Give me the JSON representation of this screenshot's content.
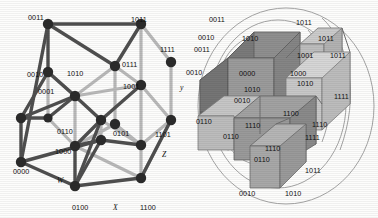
{
  "figure": {
    "panels": [
      {
        "id": "left",
        "name": "hypercube-graph",
        "type": "tesseract-wireframe",
        "axis_labels": [
          {
            "text": "W",
            "x": 57,
            "y": 177
          },
          {
            "text": "X",
            "x": 113,
            "y": 204
          },
          {
            "text": "Z",
            "x": 162,
            "y": 151
          },
          {
            "text": "y",
            "x": 180,
            "y": 84
          }
        ],
        "vertex_labels": [
          {
            "text": "0011",
            "x": 28,
            "y": 14
          },
          {
            "text": "1011",
            "x": 131,
            "y": 16
          },
          {
            "text": "1111",
            "x": 160,
            "y": 46
          },
          {
            "text": "0010",
            "x": 27,
            "y": 71
          },
          {
            "text": "1010",
            "x": 67,
            "y": 70
          },
          {
            "text": "0111",
            "x": 122,
            "y": 61
          },
          {
            "text": "1001",
            "x": 123,
            "y": 83
          },
          {
            "text": "0001",
            "x": 38,
            "y": 88
          },
          {
            "text": "0110",
            "x": 57,
            "y": 128
          },
          {
            "text": "0101",
            "x": 113,
            "y": 130
          },
          {
            "text": "1101",
            "x": 155,
            "y": 131
          },
          {
            "text": "1000",
            "x": 55,
            "y": 148
          },
          {
            "text": "0000",
            "x": 13,
            "y": 168
          },
          {
            "text": "0100",
            "x": 72,
            "y": 204
          },
          {
            "text": "1100",
            "x": 140,
            "y": 204
          }
        ]
      },
      {
        "id": "right",
        "name": "nested-cubes-diagram",
        "type": "cube-cluster-with-contours",
        "vertex_labels": [
          {
            "text": "0011",
            "x": 209,
            "y": 16
          },
          {
            "text": "1011",
            "x": 296,
            "y": 19
          },
          {
            "text": "0010",
            "x": 198,
            "y": 34
          },
          {
            "text": "1010",
            "x": 242,
            "y": 35
          },
          {
            "text": "1011",
            "x": 318,
            "y": 35
          },
          {
            "text": "0011",
            "x": 194,
            "y": 46
          },
          {
            "text": "1001",
            "x": 297,
            "y": 52
          },
          {
            "text": "1011",
            "x": 330,
            "y": 52
          },
          {
            "text": "0010",
            "x": 186,
            "y": 69
          },
          {
            "text": "0000",
            "x": 239,
            "y": 70
          },
          {
            "text": "1000",
            "x": 290,
            "y": 70
          },
          {
            "text": "1010",
            "x": 297,
            "y": 80
          },
          {
            "text": "1010",
            "x": 244,
            "y": 86
          },
          {
            "text": "0010",
            "x": 234,
            "y": 97
          },
          {
            "text": "1111",
            "x": 334,
            "y": 93
          },
          {
            "text": "0110",
            "x": 196,
            "y": 118
          },
          {
            "text": "1100",
            "x": 283,
            "y": 110
          },
          {
            "text": "1110",
            "x": 245,
            "y": 122
          },
          {
            "text": "1110",
            "x": 312,
            "y": 121
          },
          {
            "text": "0110",
            "x": 223,
            "y": 133
          },
          {
            "text": "1111",
            "x": 305,
            "y": 134
          },
          {
            "text": "1110",
            "x": 265,
            "y": 145
          },
          {
            "text": "0110",
            "x": 254,
            "y": 156
          },
          {
            "text": "1011",
            "x": 305,
            "y": 167
          },
          {
            "text": "0010",
            "x": 239,
            "y": 190
          },
          {
            "text": "1010",
            "x": 285,
            "y": 190
          }
        ]
      }
    ],
    "colors": {
      "ink": "#111111",
      "edge_dark": "#4a4a4a",
      "edge_light": "#b9b9b9",
      "node": "#2b2b2b",
      "face_dark": "#7d7d7d",
      "face_mid": "#9a9a9a",
      "face_light": "#bdbdbd",
      "face_lighter": "#d2d2d2",
      "contour": "#8a8a8a",
      "background": "#fdfdfc"
    }
  }
}
